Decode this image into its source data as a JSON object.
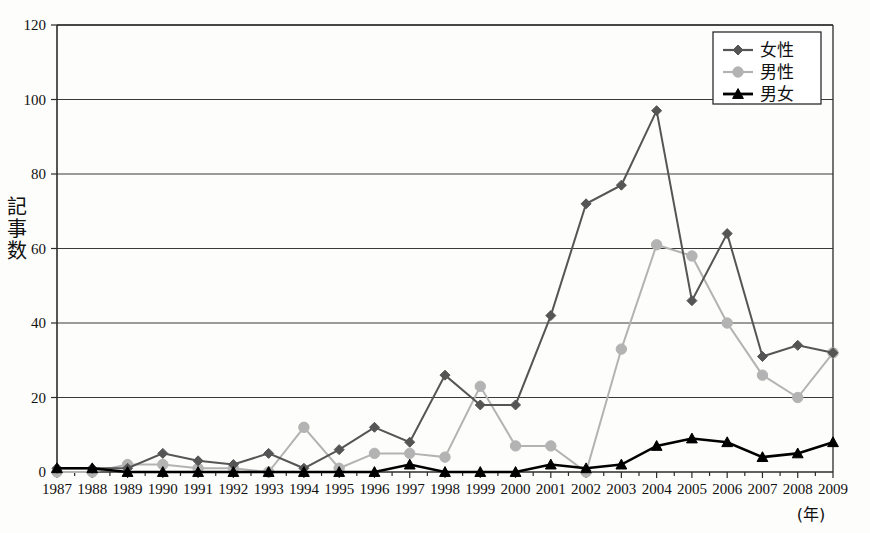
{
  "chart_data": {
    "type": "line",
    "title": "",
    "xlabel": "(年)",
    "ylabel": "記事数",
    "ylim": [
      0,
      120
    ],
    "ytick_step": 20,
    "yticks": [
      0,
      20,
      40,
      60,
      80,
      100,
      120
    ],
    "grid": "horizontal",
    "legend_position": "top-right",
    "categories": [
      "1987",
      "1988",
      "1989",
      "1990",
      "1991",
      "1992",
      "1993",
      "1994",
      "1995",
      "1996",
      "1997",
      "1998",
      "1999",
      "2000",
      "2001",
      "2002",
      "2003",
      "2004",
      "2005",
      "2006",
      "2007",
      "2008",
      "2009"
    ],
    "series": [
      {
        "name": "女性",
        "color": "#555555",
        "marker": "diamond",
        "values": [
          1,
          1,
          1,
          5,
          3,
          2,
          5,
          1,
          6,
          12,
          8,
          26,
          18,
          18,
          42,
          72,
          77,
          97,
          46,
          64,
          31,
          34,
          32
        ]
      },
      {
        "name": "男性",
        "color": "#b3b3b3",
        "marker": "circle",
        "values": [
          0,
          0,
          2,
          2,
          1,
          1,
          0,
          12,
          1,
          5,
          5,
          4,
          23,
          7,
          7,
          0,
          33,
          61,
          58,
          40,
          26,
          20,
          32
        ]
      },
      {
        "name": "男女",
        "color": "#000000",
        "marker": "triangle",
        "values": [
          1,
          1,
          0,
          0,
          0,
          0,
          0,
          0,
          0,
          0,
          2,
          0,
          0,
          0,
          2,
          1,
          2,
          7,
          9,
          8,
          4,
          5,
          8
        ]
      }
    ]
  },
  "legend": {
    "items": [
      {
        "label": "女性"
      },
      {
        "label": "男性"
      },
      {
        "label": "男女"
      }
    ]
  },
  "axes": {
    "y_title": "記事数",
    "y_title_chars": [
      "記",
      "事",
      "数"
    ],
    "x_unit": "(年)"
  }
}
